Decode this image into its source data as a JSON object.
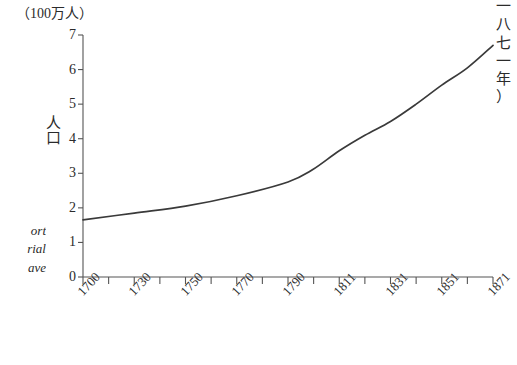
{
  "labels": {
    "unit": "（100万人）",
    "y_axis_title": [
      "人",
      "口"
    ],
    "right_vertical": [
      "一",
      "八",
      "七",
      "一",
      "年",
      "）"
    ],
    "side_note": [
      "ort",
      "rial",
      "ave"
    ]
  },
  "colors": {
    "line": "#3a3a3a",
    "axis": "#555555",
    "text": "#2b2b2b",
    "background": "#ffffff"
  },
  "chart_data": {
    "type": "line",
    "title": "",
    "subtitle": "",
    "xlabel": "",
    "ylabel": "人口",
    "unit_note": "（100万人）",
    "xlim": [
      1700,
      1871
    ],
    "ylim": [
      0,
      7
    ],
    "grid": false,
    "legend": null,
    "x_tick_labels": [
      "1700",
      "1730",
      "1750",
      "1770",
      "1790",
      "1811",
      "1831",
      "1851",
      "1871"
    ],
    "x_tick_values": [
      1700,
      1730,
      1750,
      1770,
      1790,
      1811,
      1831,
      1851,
      1871
    ],
    "y_tick_labels": [
      "0",
      "1",
      "2",
      "3",
      "4",
      "5",
      "6",
      "7"
    ],
    "y_tick_values": [
      0,
      1,
      2,
      3,
      4,
      5,
      6,
      7
    ],
    "minor_ticks_between": 1,
    "series": [
      {
        "name": "人口",
        "x": [
          1700,
          1730,
          1750,
          1770,
          1790,
          1800,
          1811,
          1821,
          1831,
          1841,
          1851,
          1861,
          1871
        ],
        "values": [
          1.65,
          1.85,
          2.05,
          2.35,
          2.75,
          3.1,
          3.65,
          4.1,
          4.5,
          5.0,
          5.55,
          6.05,
          6.7
        ]
      }
    ]
  }
}
